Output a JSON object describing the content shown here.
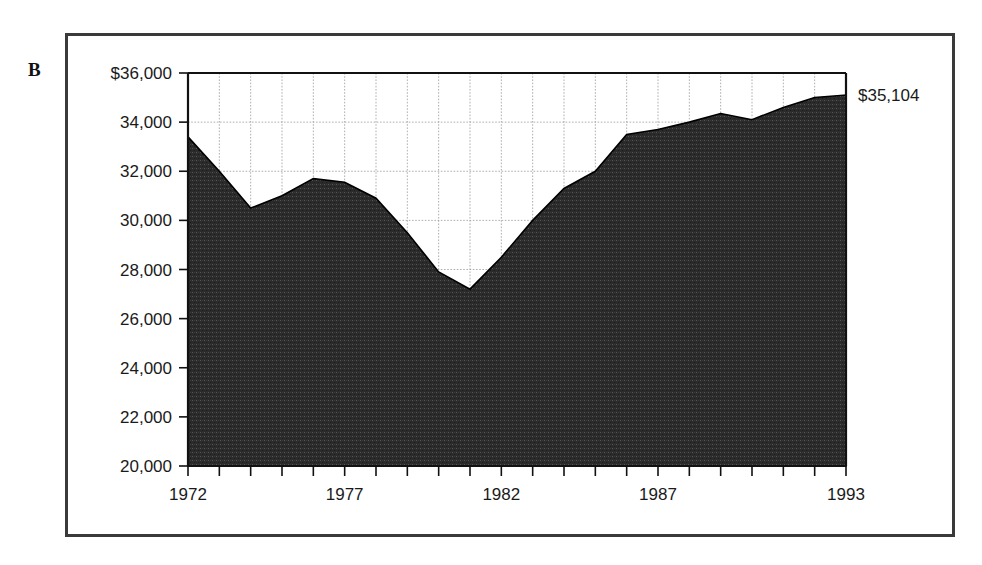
{
  "panel": {
    "letter": "B"
  },
  "colors": {
    "frame": "#3a3a3a",
    "area_fill": "#2b2b2b",
    "grid": "#9a9a9a",
    "axis": "#111111",
    "background": "#ffffff"
  },
  "annotations": {
    "end_value_label": "$35,104"
  },
  "chart_data": {
    "type": "area",
    "title": "",
    "subtitle": "",
    "xlabel": "",
    "ylabel": "",
    "grid": true,
    "legend": "none",
    "xlim": [
      1972,
      1993
    ],
    "ylim": [
      20000,
      36000
    ],
    "ytick_labels": [
      "$36,000",
      "34,000",
      "32,000",
      "30,000",
      "28,000",
      "26,000",
      "24,000",
      "22,000",
      "20,000"
    ],
    "ytick_values": [
      36000,
      34000,
      32000,
      30000,
      28000,
      26000,
      24000,
      22000,
      20000
    ],
    "xtick_labels": [
      "1972",
      "1977",
      "1982",
      "1987",
      "1993"
    ],
    "xtick_values": [
      1972,
      1977,
      1982,
      1987,
      1993
    ],
    "x": [
      1972,
      1973,
      1974,
      1975,
      1976,
      1977,
      1978,
      1979,
      1980,
      1981,
      1982,
      1983,
      1984,
      1985,
      1986,
      1987,
      1988,
      1989,
      1990,
      1991,
      1992,
      1993
    ],
    "values": [
      33400,
      32000,
      30500,
      31000,
      31700,
      31550,
      30900,
      29500,
      27900,
      27200,
      28500,
      30000,
      31300,
      32000,
      33500,
      33700,
      34000,
      34350,
      34100,
      34600,
      35000,
      35104
    ],
    "series": [
      {
        "name": "value",
        "values": [
          33400,
          32000,
          30500,
          31000,
          31700,
          31550,
          30900,
          29500,
          27900,
          27200,
          28500,
          30000,
          31300,
          32000,
          33500,
          33700,
          34000,
          34350,
          34100,
          34600,
          35000,
          35104
        ]
      }
    ]
  }
}
